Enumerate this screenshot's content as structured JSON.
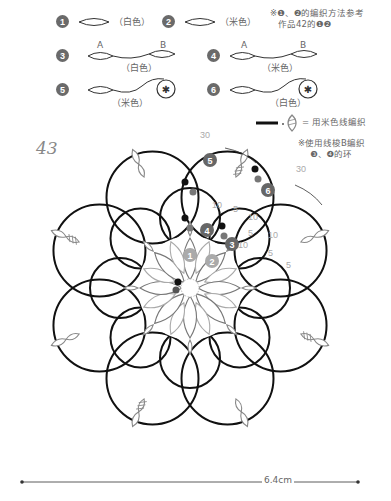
{
  "figure_number": "43",
  "legend": {
    "items": [
      {
        "num": "1",
        "label": "（白色）",
        "type": "ring"
      },
      {
        "num": "2",
        "label": "（米色）",
        "type": "ring"
      },
      {
        "num": "3",
        "label": "（白色）",
        "type": "ring-chain-ring",
        "a": "A",
        "b": "B"
      },
      {
        "num": "4",
        "label": "（米色）",
        "type": "ring-chain-ring",
        "a": "A",
        "b": "B"
      },
      {
        "num": "5",
        "label": "（米色）",
        "type": "ring-chain-shuttle"
      },
      {
        "num": "6",
        "label": "（白色）",
        "type": "ring-chain-shuttle"
      }
    ],
    "note1_line1": "※❶、❷的编织方法参考",
    "note1_line2": "作品42的❶❷",
    "color_key": "= 用米色线编织",
    "note2_line1": "※使用线梭B编织",
    "note2_line2": "❸、❹的环"
  },
  "diagram": {
    "step_markers": [
      "1",
      "2",
      "3",
      "4",
      "5",
      "6"
    ],
    "stitch_counts": [
      "30",
      "30",
      "10",
      "10",
      "5",
      "5",
      "10",
      "5",
      "5",
      "10"
    ],
    "colors": {
      "beige_thread": "#111111",
      "white_thread": "#888888",
      "marker": "#6a6a6a"
    }
  },
  "dimension": {
    "label": "6.4cm"
  }
}
